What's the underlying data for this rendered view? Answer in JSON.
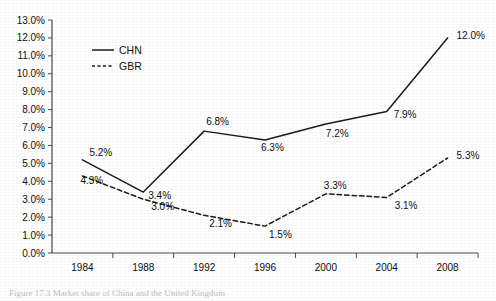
{
  "chart_data": {
    "type": "line",
    "title": "",
    "xlabel": "",
    "ylabel": "",
    "categories": [
      "1984",
      "1988",
      "1992",
      "1996",
      "2000",
      "2004",
      "2008"
    ],
    "ylim": [
      0,
      13
    ],
    "ytick_step": 1,
    "ytick_labels": [
      "0.0%",
      "1.0%",
      "2.0%",
      "3.0%",
      "4.0%",
      "5.0%",
      "6.0%",
      "7.0%",
      "8.0%",
      "9.0%",
      "10.0%",
      "11.0%",
      "12.0%",
      "13.0%"
    ],
    "grid": false,
    "legend_position": "top-left-inside",
    "series": [
      {
        "name": "CHN",
        "style": "solid",
        "color": "#1b1b1b",
        "values": [
          5.2,
          3.4,
          6.8,
          6.3,
          7.2,
          7.9,
          12.0
        ],
        "point_labels": [
          "5.2%",
          "3.4%",
          "6.8%",
          "6.3%",
          "7.2%",
          "7.9%",
          "12.0%"
        ]
      },
      {
        "name": "GBR",
        "style": "dashed",
        "color": "#1b1b1b",
        "values": [
          4.3,
          3.0,
          2.1,
          1.5,
          3.3,
          3.1,
          5.3
        ],
        "point_labels": [
          "4.3%",
          "3.0%",
          "2.1%",
          "1.5%",
          "3.3%",
          "3.1%",
          "5.3%"
        ]
      }
    ]
  },
  "legend": {
    "entries": [
      {
        "label": "CHN",
        "style": "solid"
      },
      {
        "label": "GBR",
        "style": "dashed"
      }
    ]
  },
  "caption": {
    "text": "Figure 17.3 Market share of China and the United Kingdom"
  }
}
